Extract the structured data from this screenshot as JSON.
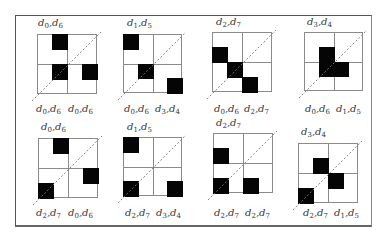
{
  "figure": {
    "panels": [
      {
        "id": 1,
        "top_label": {
          "a": "d",
          "a_sub": "0",
          "b": "d",
          "b_sub": "6"
        },
        "bottom_left": {
          "a": "d",
          "a_sub": "0",
          "b": "d",
          "b_sub": "6"
        },
        "bottom_right": {
          "a": "d",
          "a_sub": "0",
          "b": "d",
          "b_sub": "6"
        },
        "blocks": [
          [
            1,
            0
          ],
          [
            1,
            2
          ],
          [
            3,
            2
          ]
        ]
      },
      {
        "id": 2,
        "top_label": {
          "a": "d",
          "a_sub": "1",
          "b": "d",
          "b_sub": "5"
        },
        "bottom_left": {
          "a": "d",
          "a_sub": "0",
          "b": "d",
          "b_sub": "6"
        },
        "bottom_right": {
          "a": "d",
          "a_sub": "3",
          "b": "d",
          "b_sub": "4"
        },
        "blocks": [
          [
            0,
            0
          ],
          [
            1,
            2
          ],
          [
            3,
            3
          ]
        ]
      },
      {
        "id": 3,
        "top_label": {
          "a": "d",
          "a_sub": "2",
          "b": "d",
          "b_sub": "7"
        },
        "bottom_left": {
          "a": "d",
          "a_sub": "0",
          "b": "d",
          "b_sub": "6"
        },
        "bottom_right": {
          "a": "d",
          "a_sub": "2",
          "b": "d",
          "b_sub": "7"
        },
        "blocks": [
          [
            0,
            1
          ],
          [
            1,
            2
          ],
          [
            2,
            3
          ]
        ]
      },
      {
        "id": 4,
        "top_label": {
          "a": "d",
          "a_sub": "3",
          "b": "d",
          "b_sub": "4"
        },
        "bottom_left": {
          "a": "d",
          "a_sub": "0",
          "b": "d",
          "b_sub": "6"
        },
        "bottom_right": {
          "a": "d",
          "a_sub": "1",
          "b": "d",
          "b_sub": "5"
        },
        "blocks": [
          [
            1,
            1
          ],
          [
            1,
            2
          ],
          [
            2,
            2
          ]
        ]
      },
      {
        "id": 5,
        "top_label": {
          "a": "d",
          "a_sub": "0",
          "b": "d",
          "b_sub": "6"
        },
        "bottom_left": {
          "a": "d",
          "a_sub": "2",
          "b": "d",
          "b_sub": "7"
        },
        "bottom_right": {
          "a": "d",
          "a_sub": "0",
          "b": "d",
          "b_sub": "6"
        },
        "blocks": [
          [
            1,
            0
          ],
          [
            3,
            2
          ],
          [
            0,
            3
          ]
        ]
      },
      {
        "id": 6,
        "top_label": {
          "a": "d",
          "a_sub": "1",
          "b": "d",
          "b_sub": "5"
        },
        "bottom_left": {
          "a": "d",
          "a_sub": "2",
          "b": "d",
          "b_sub": "7"
        },
        "bottom_right": {
          "a": "d",
          "a_sub": "3",
          "b": "d",
          "b_sub": "4"
        },
        "blocks": [
          [
            0,
            0
          ],
          [
            0,
            3
          ],
          [
            3,
            3
          ]
        ]
      },
      {
        "id": 7,
        "top_label": {
          "a": "d",
          "a_sub": "2",
          "b": "d",
          "b_sub": "7"
        },
        "bottom_left": {
          "a": "d",
          "a_sub": "2",
          "b": "d",
          "b_sub": "7"
        },
        "bottom_right": {
          "a": "d",
          "a_sub": "2",
          "b": "d",
          "b_sub": "7"
        },
        "blocks": [
          [
            0,
            1
          ],
          [
            0,
            3
          ],
          [
            2,
            3
          ]
        ]
      },
      {
        "id": 8,
        "top_label": {
          "a": "d",
          "a_sub": "3",
          "b": "d",
          "b_sub": "4"
        },
        "bottom_left": {
          "a": "d",
          "a_sub": "2",
          "b": "d",
          "b_sub": "7"
        },
        "bottom_right": {
          "a": "d",
          "a_sub": "1",
          "b": "d",
          "b_sub": "5"
        },
        "blocks": [
          [
            1,
            1
          ],
          [
            2,
            2
          ],
          [
            0,
            3
          ]
        ]
      }
    ]
  }
}
